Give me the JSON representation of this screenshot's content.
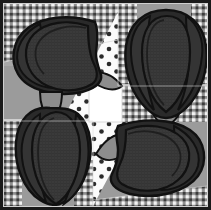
{
  "artwork": {
    "title": "Bell Pepper Quilt Block",
    "type": "quilt-applique-illustration",
    "width": 211,
    "height": 210,
    "palette": {
      "outline": "#111111",
      "pepper_body": "#3a3a3a",
      "pepper_shade": "#2a2a2a",
      "pepper_rim": "#232323",
      "stem": "#8d8d8d",
      "stem_shade": "#7b7b7b",
      "background_gray": "#9b9b9b",
      "background_gray_light": "#b4b4b4",
      "dot_fabric_base": "#fbfbfb",
      "dot_color": "#2b2b2b",
      "gingham_dark": "#3c3c3c",
      "gingham_mid": "#8f8f8f",
      "gingham_light": "#f2f2f2",
      "center_square": "#ffffff",
      "border": "#1a1a1a"
    },
    "composition": {
      "layout": "2x2 pinwheel of four appliqué blocks",
      "center_square_label": "white center square",
      "seam_lines": "light gray piecing seams",
      "block_count": 4
    },
    "blocks": [
      {
        "id": "block-top-left",
        "label": "Pepper block — top left",
        "orientation": "stem pointing right",
        "fabrics": [
          "gingham-check",
          "solid-gray",
          "white-polka-dot"
        ]
      },
      {
        "id": "block-top-right",
        "label": "Pepper block — top right",
        "orientation": "stem pointing down",
        "fabrics": [
          "gingham-check",
          "solid-gray",
          "white-polka-dot"
        ]
      },
      {
        "id": "block-bottom-left",
        "label": "Pepper block — bottom left",
        "orientation": "stem pointing up",
        "fabrics": [
          "gingham-check",
          "solid-gray",
          "white-polka-dot"
        ]
      },
      {
        "id": "block-bottom-right",
        "label": "Pepper block — bottom right",
        "orientation": "stem pointing left",
        "fabrics": [
          "gingham-check",
          "solid-gray",
          "white-polka-dot"
        ]
      }
    ],
    "elements": {
      "gingham_patch": "gingham-check-fabric",
      "dot_patch": "polka-dot-fabric",
      "gray_patch": "solid-gray-fabric",
      "pepper": "bell-pepper-shape",
      "stem": "pepper-stem-shape",
      "center": "center-white-square",
      "border": "outer-border"
    }
  }
}
